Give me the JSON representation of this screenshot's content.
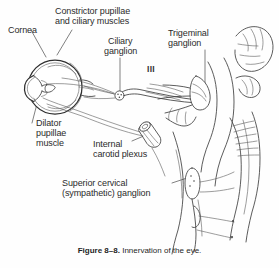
{
  "figure": {
    "caption_number": "Figure 8–8.",
    "caption_text": "Innervation of the eye.",
    "background_color": "#fefefe",
    "ink_color": "#3a3a3a",
    "text_color": "#2b2b2b"
  },
  "labels": {
    "cornea": "Cornea",
    "constrictor_line1": "Constrictor pupillae",
    "constrictor_line2": "and ciliary muscles",
    "ciliary_ganglion_line1": "Ciliary",
    "ciliary_ganglion_line2": "ganglion",
    "trigeminal_line1": "Trigeminal",
    "trigeminal_line2": "ganglion",
    "cranial_nerve_three": "III",
    "dilator_line1": "Dilator",
    "dilator_line2": "pupillae",
    "dilator_line3": "muscle",
    "internal_carotid_line1": "Internal",
    "internal_carotid_line2": "carotid plexus",
    "superior_cervical_line1": "Superior cervical",
    "superior_cervical_line2": "(sympathetic) ganglion"
  },
  "structures": [
    {
      "name": "eyeball-cross-section",
      "description": "sagittal section of eye with cornea, lens, iris, retina"
    },
    {
      "name": "ciliary-ganglion-marker",
      "description": "small stippled circle on short postganglionic branch"
    },
    {
      "name": "oculomotor-nerve-III",
      "description": "nerve bundle running from brainstem to ciliary ganglion"
    },
    {
      "name": "trigeminal-ganglion",
      "description": "flattened crescent ganglion at base of brainstem"
    },
    {
      "name": "internal-carotid-artery",
      "description": "cut tubular artery segment bearing carotid plexus"
    },
    {
      "name": "brainstem-and-cerebellum",
      "description": "outline of pons, medulla and cerebellar folia"
    },
    {
      "name": "spinal-cord-and-sympathetic-chain",
      "description": "cord with chain ganglia and rami"
    },
    {
      "name": "superior-cervical-ganglion",
      "description": "fusiform ganglion at top of sympathetic chain"
    }
  ]
}
